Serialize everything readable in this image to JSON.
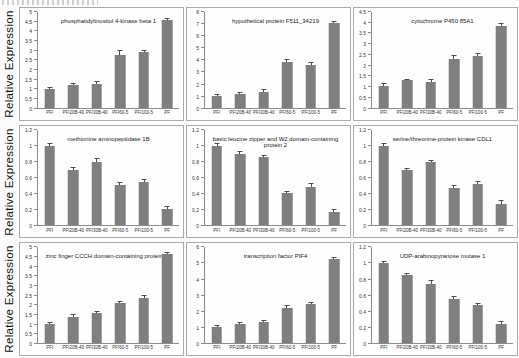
{
  "figure": {
    "row_axis_label": "Relative Expression"
  },
  "style": {
    "bar_color": "#7f7f7f",
    "error_color": "#4d4d4d",
    "axis_color": "#8c8c8c",
    "panel_border": "#ababab",
    "page_bg": "#fcfcfc"
  },
  "chart_data": [
    {
      "type": "bar",
      "title": "phosphatidylinositol 4-kinase beta 1",
      "categories": [
        "PFI",
        "PFI20B-40",
        "PFI30B-40",
        "PFI60-5",
        "PFI100-5",
        "PF"
      ],
      "values": [
        1.0,
        1.2,
        1.25,
        2.75,
        2.9,
        4.6
      ],
      "errors": [
        0.04,
        0.05,
        0.08,
        0.2,
        0.07,
        0.05
      ],
      "ylabel": "Relative Expression",
      "ylim": [
        0,
        5
      ],
      "ytick_step": 0.5,
      "grid": false,
      "legend": "none"
    },
    {
      "type": "bar",
      "title": "hypothetical protein F511_34219",
      "categories": [
        "PFI",
        "PFI20B-40",
        "PFI30B-40",
        "PFI60-5",
        "PFI100-5",
        "PF"
      ],
      "values": [
        1.0,
        1.15,
        1.3,
        3.8,
        3.6,
        7.1
      ],
      "errors": [
        0.1,
        0.08,
        0.18,
        0.15,
        0.1,
        0.08
      ],
      "ylabel": "Relative Expression",
      "ylim": [
        0,
        8
      ],
      "ytick_step": 1,
      "grid": false,
      "legend": "none"
    },
    {
      "type": "bar",
      "title": "cytochrome P450 85A1",
      "categories": [
        "PFI",
        "PFI20B-40",
        "PFI30B-40",
        "PFI60-5",
        "PFI100-5",
        "PF"
      ],
      "values": [
        1.0,
        1.28,
        1.2,
        2.28,
        2.45,
        3.85
      ],
      "errors": [
        0.1,
        0.04,
        0.1,
        0.13,
        0.08,
        0.08
      ],
      "ylabel": "Relative Expression",
      "ylim": [
        0,
        4.5
      ],
      "ytick_step": 0.5,
      "grid": false,
      "legend": "none"
    },
    {
      "type": "bar",
      "title": "methionine aminopeptidase 1B",
      "categories": [
        "PFI",
        "PFI20B-40",
        "PFI30B-40",
        "PFI60-5",
        "PFI100-5",
        "PF"
      ],
      "values": [
        1.0,
        0.7,
        0.8,
        0.5,
        0.55,
        0.2
      ],
      "errors": [
        0.02,
        0.02,
        0.03,
        0.03,
        0.02,
        0.03
      ],
      "ylabel": "Relative Expression",
      "ylim": [
        0,
        1.2
      ],
      "ytick_step": 0.2,
      "grid": false,
      "legend": "none"
    },
    {
      "type": "bar",
      "title": "basic leucine zipper and W2 domain-containing protein 2",
      "categories": [
        "PFI",
        "PFI20B-40",
        "PFI30B-40",
        "PFI60-5",
        "PFI100-5",
        "PF"
      ],
      "values": [
        1.0,
        0.9,
        0.86,
        0.4,
        0.48,
        0.17
      ],
      "errors": [
        0.02,
        0.02,
        0.01,
        0.02,
        0.04,
        0.02
      ],
      "ylabel": "Relative Expression",
      "ylim": [
        0,
        1.2
      ],
      "ytick_step": 0.2,
      "grid": false,
      "legend": "none"
    },
    {
      "type": "bar",
      "title": "serine/threonine-protein kinase CDL1",
      "categories": [
        "PFI",
        "PFI20B-40",
        "PFI30B-40",
        "PFI60-5",
        "PFI100-5",
        "PF"
      ],
      "values": [
        1.0,
        0.69,
        0.79,
        0.47,
        0.52,
        0.27
      ],
      "errors": [
        0.02,
        0.02,
        0.02,
        0.02,
        0.02,
        0.04
      ],
      "ylabel": "Relative Expression",
      "ylim": [
        0,
        1.2
      ],
      "ytick_step": 0.2,
      "grid": false,
      "legend": "none"
    },
    {
      "type": "bar",
      "title": "zinc finger CCCH domain-containing protein 48",
      "categories": [
        "PFI",
        "PFI20B-40",
        "PFI30B-40",
        "PFI60-5",
        "PFI100-5",
        "PF"
      ],
      "values": [
        1.0,
        1.35,
        1.55,
        2.1,
        2.35,
        4.65
      ],
      "errors": [
        0.04,
        0.12,
        0.05,
        0.07,
        0.1,
        0.06
      ],
      "ylabel": "Relative Expression",
      "ylim": [
        0,
        5
      ],
      "ytick_step": 0.5,
      "grid": false,
      "legend": "none"
    },
    {
      "type": "bar",
      "title": "transcription factor PIF4",
      "categories": [
        "PFI",
        "PFI20B-40",
        "PFI30B-40",
        "PFI60-5",
        "PFI100-5",
        "PF"
      ],
      "values": [
        1.0,
        1.2,
        1.3,
        2.2,
        2.45,
        5.3
      ],
      "errors": [
        0.05,
        0.07,
        0.06,
        0.1,
        0.07,
        0.06
      ],
      "ylabel": "Relative Expression",
      "ylim": [
        0,
        6
      ],
      "ytick_step": 1,
      "grid": false,
      "legend": "none"
    },
    {
      "type": "bar",
      "title": "UDP-arabinopyranose mutase 1",
      "categories": [
        "PFI",
        "PFI20B-40",
        "PFI30B-40",
        "PFI60-5",
        "PFI100-5",
        "PF"
      ],
      "values": [
        1.0,
        0.85,
        0.74,
        0.55,
        0.48,
        0.24
      ],
      "errors": [
        0.02,
        0.02,
        0.04,
        0.03,
        0.01,
        0.02
      ],
      "ylabel": "Relative Expression",
      "ylim": [
        0,
        1.2
      ],
      "ytick_step": 0.2,
      "grid": false,
      "legend": "none"
    }
  ]
}
